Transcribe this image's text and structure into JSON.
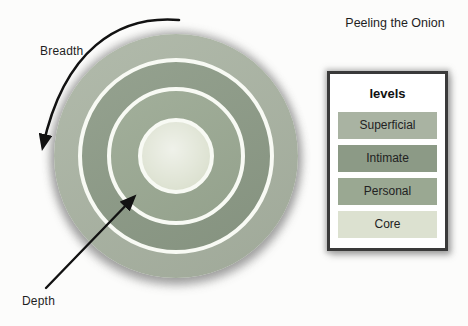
{
  "title": "Peeling the Onion",
  "annotations": {
    "breadth_label": "Breadth",
    "depth_label": "Depth"
  },
  "onion": {
    "rings": [
      {
        "level": "Superficial",
        "position": "outer ring",
        "color": "#a9b3a2"
      },
      {
        "level": "Intimate",
        "position": "second ring",
        "color": "#8c9a86"
      },
      {
        "level": "Personal",
        "position": "third ring",
        "color": "#9aa892"
      },
      {
        "level": "Core",
        "position": "center circle",
        "color": "#dce1d0"
      }
    ]
  },
  "legend": {
    "header": "levels",
    "items": [
      {
        "label": "Superficial",
        "color": "#a9b3a2"
      },
      {
        "label": "Intimate",
        "color": "#8c9a86"
      },
      {
        "label": "Personal",
        "color": "#9aa892"
      },
      {
        "label": "Core",
        "color": "#dce1d0"
      }
    ]
  },
  "colors": {
    "arrow": "#121212",
    "legend_border": "#3a3a3a",
    "ring_separator": "#f8faf4",
    "background": "#fcfcfb"
  }
}
